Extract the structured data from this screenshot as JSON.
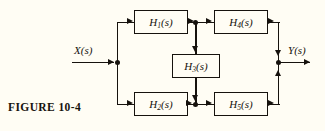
{
  "figure": {
    "caption": "FIGURE 10-4",
    "background_color": "#fffdf4",
    "ink_color": "#16120d"
  },
  "diagram": {
    "type": "block-diagram",
    "domain": "Laplace transfer-function block diagram",
    "input": {
      "name": "input-signal",
      "label": "X(s)",
      "base": "X",
      "arg": "(s)"
    },
    "output": {
      "name": "output-signal",
      "label": "Y(s)",
      "base": "Y",
      "arg": "(s)"
    },
    "blocks": [
      {
        "id": "h1",
        "base": "H",
        "sub": "1",
        "arg": "(s)",
        "label": "H1(s)",
        "position": "top-left"
      },
      {
        "id": "h4",
        "base": "H",
        "sub": "4",
        "arg": "(s)",
        "label": "H4(s)",
        "position": "top-right"
      },
      {
        "id": "h3",
        "base": "H",
        "sub": "3",
        "arg": "(s)",
        "label": "H3(s)",
        "position": "middle-center"
      },
      {
        "id": "h2",
        "base": "H",
        "sub": "2",
        "arg": "(s)",
        "label": "H2(s)",
        "position": "bottom-left"
      },
      {
        "id": "h5",
        "base": "H",
        "sub": "5",
        "arg": "(s)",
        "label": "H5(s)",
        "position": "bottom-right"
      }
    ],
    "nodes": [
      {
        "id": "input-split",
        "kind": "junction-dot"
      },
      {
        "id": "top-split",
        "kind": "junction-dot"
      },
      {
        "id": "bottom-sum",
        "kind": "junction-dot"
      },
      {
        "id": "output-sum",
        "kind": "junction-dot"
      }
    ],
    "connections": [
      {
        "from": "X(s)",
        "to": "input-split"
      },
      {
        "from": "input-split",
        "to": "H1(s)"
      },
      {
        "from": "input-split",
        "to": "H2(s)"
      },
      {
        "from": "H1(s)",
        "to": "top-split"
      },
      {
        "from": "top-split",
        "to": "H4(s)"
      },
      {
        "from": "top-split",
        "to": "H3(s)"
      },
      {
        "from": "H3(s)",
        "to": "bottom-sum"
      },
      {
        "from": "H2(s)",
        "to": "bottom-sum"
      },
      {
        "from": "bottom-sum",
        "to": "H5(s)"
      },
      {
        "from": "H4(s)",
        "to": "output-sum"
      },
      {
        "from": "H5(s)",
        "to": "output-sum"
      },
      {
        "from": "output-sum",
        "to": "Y(s)"
      }
    ]
  }
}
